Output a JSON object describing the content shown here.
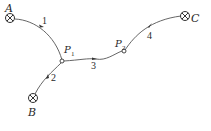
{
  "diagram": {
    "type": "flow-network",
    "nodes": {
      "A": {
        "label": "A",
        "kind": "source"
      },
      "B": {
        "label": "B",
        "kind": "source"
      },
      "C": {
        "label": "C",
        "kind": "sink"
      },
      "P1": {
        "label": "P",
        "sub": "1",
        "kind": "junction"
      },
      "P2": {
        "label": "P",
        "sub": "2",
        "kind": "junction"
      }
    },
    "edges": [
      {
        "id": "1",
        "label": "1",
        "from": "A",
        "to": "P1"
      },
      {
        "id": "2",
        "label": "2",
        "from": "B",
        "to": "P1"
      },
      {
        "id": "3",
        "label": "3",
        "from": "P1",
        "to": "P2"
      },
      {
        "id": "4",
        "label": "4",
        "from": "P2",
        "to": "C"
      }
    ]
  }
}
